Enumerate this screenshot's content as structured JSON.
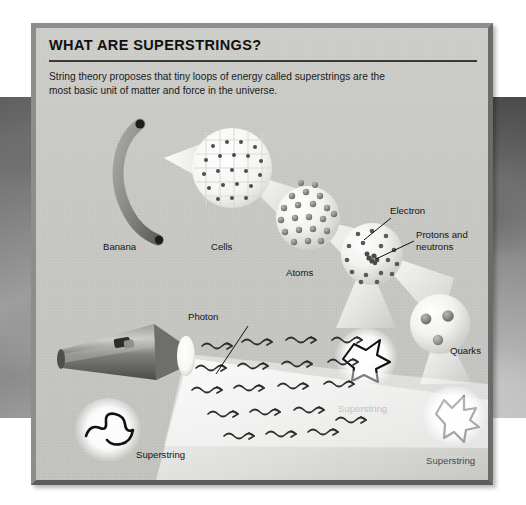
{
  "panel": {
    "title": "WHAT ARE SUPERSTRINGS?",
    "blurb": "String theory proposes that tiny loops of energy called superstrings are the most basic unit of matter and force in the universe."
  },
  "labels": {
    "banana": "Banana",
    "cells": "Cells",
    "atoms": "Atoms",
    "electron": "Electron",
    "protons_neutrons": "Protons and\nneutrons",
    "protons_neutrons_line1": "Protons and",
    "protons_neutrons_line2": "neutrons",
    "quarks": "Quarks",
    "superstring_mid": "Superstring",
    "superstring_right": "Superstring",
    "photon": "Photon",
    "superstring_left": "Superstring"
  },
  "colors": {
    "panel_background": "#c9c9c6",
    "frame_light": "#8d8d8d",
    "frame_dark": "#5d5d5d",
    "rule": "#3a3a3a",
    "text": "#141414",
    "banana_body": "#8a8a8a",
    "banana_tip": "#1d1d1d",
    "flashlight_body": "#6f6f6f",
    "light_beam": "#ffffff"
  },
  "icons": {
    "banana": "banana-icon",
    "cells": "cells-sphere-icon",
    "atoms": "atoms-sphere-icon",
    "atom": "atom-sphere-icon",
    "nucleus": "nucleus-icon",
    "quarks": "quark-sphere-icon",
    "superstring": "superstring-loop-icon",
    "flashlight": "flashlight-icon",
    "photon": "photon-wave-icon"
  },
  "structure": {
    "chain": [
      "Banana",
      "Cells",
      "Atoms",
      "Electron / Protons and neutrons",
      "Quarks",
      "Superstring"
    ],
    "second_chain": [
      "Flashlight",
      "Photon",
      "Superstring"
    ]
  }
}
